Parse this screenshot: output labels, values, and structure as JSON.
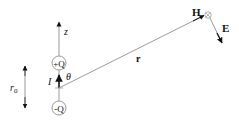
{
  "diagram": {
    "labels": {
      "z_axis": "z",
      "positive_charge": "+Q",
      "negative_charge": "-Q",
      "current": "I",
      "angle": "θ",
      "separation": "r",
      "separation_sub": "0",
      "radius": "r",
      "magnetic_field": "H",
      "electric_field": "E"
    },
    "colors": {
      "line": "#9a9a9a",
      "arrow": "#111111",
      "text": "#111111",
      "circle": "#9a9a9a"
    },
    "icons": {
      "h_field_symbol": "circle-cross-into-page"
    }
  }
}
